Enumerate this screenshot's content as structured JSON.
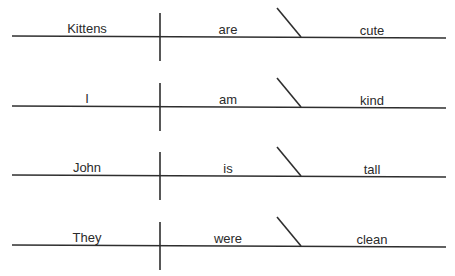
{
  "diagram": {
    "type": "sentence-diagram",
    "colors": {
      "background": "#ffffff",
      "line": "#2e2e2e",
      "text": "#2b2b2b"
    },
    "layout": {
      "width": 455,
      "height": 276,
      "baseline_left_x": 12,
      "baseline_right_x": 446,
      "divider_x": 160,
      "diagonal_top_x": 277,
      "diagonal_bottom_x": 301,
      "diagonal_rise": 29,
      "divider_up": 24,
      "divider_down": 24,
      "subject_center_x": 87,
      "verb_center_x": 228,
      "complement_center_x": 372,
      "row_baseline_y": [
        37,
        107,
        176,
        246
      ],
      "baseline_slope_y": 2
    },
    "rows": [
      {
        "subject": "Kittens",
        "verb": "are",
        "complement": "cute"
      },
      {
        "subject": "I",
        "verb": "am",
        "complement": "kind"
      },
      {
        "subject": "John",
        "verb": "is",
        "complement": "tall"
      },
      {
        "subject": "They",
        "verb": "were",
        "complement": "clean"
      }
    ]
  }
}
